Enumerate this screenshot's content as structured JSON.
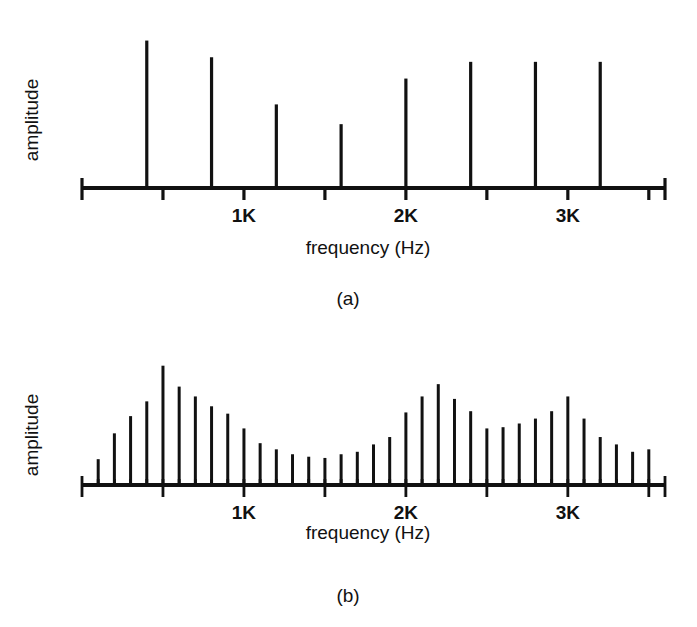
{
  "figure": {
    "background_color": "#ffffff",
    "ink_color": "#111111",
    "panels": [
      {
        "id": "a",
        "caption": "(a)",
        "ylabel": "amplitude",
        "xlabel": "frequency (Hz)",
        "tick_labels": [
          "1K",
          "2K",
          "3K"
        ]
      },
      {
        "id": "b",
        "caption": "(b)",
        "ylabel": "amplitude",
        "xlabel": "frequency (Hz)",
        "tick_labels": [
          "1K",
          "2K",
          "3K"
        ]
      }
    ]
  },
  "chart_data": [
    {
      "type": "bar",
      "id": "panel-a-spectrum",
      "title": "(a)",
      "xlabel": "frequency (Hz)",
      "ylabel": "amplitude",
      "xlim": [
        0,
        3600
      ],
      "ylim": [
        0,
        1.0
      ],
      "grid": false,
      "legend": "none",
      "xticks": [
        0,
        400,
        800,
        1200,
        1600,
        2000,
        2400,
        2800,
        3200,
        3600
      ],
      "xtick_labels": [
        "",
        "",
        "1K",
        "",
        "2K",
        "",
        "3K",
        "",
        "",
        ""
      ],
      "labeled_xticks": [
        {
          "value": 1000,
          "label": "1K"
        },
        {
          "value": 2000,
          "label": "2K"
        },
        {
          "value": 3000,
          "label": "3K"
        }
      ],
      "note": "Harmonic line spectrum: 8 discrete partials at multiples of ~400 Hz",
      "x": [
        400,
        800,
        1200,
        1600,
        2000,
        2400,
        2800,
        3200
      ],
      "values": [
        0.97,
        0.86,
        0.55,
        0.42,
        0.72,
        0.83,
        0.83,
        0.83
      ]
    },
    {
      "type": "bar",
      "id": "panel-b-spectrum",
      "title": "(b)",
      "xlabel": "frequency (Hz)",
      "ylabel": "amplitude",
      "xlim": [
        0,
        3600
      ],
      "ylim": [
        0,
        1.0
      ],
      "grid": false,
      "legend": "none",
      "labeled_xticks": [
        {
          "value": 1000,
          "label": "1K"
        },
        {
          "value": 2000,
          "label": "2K"
        },
        {
          "value": 3000,
          "label": "3K"
        }
      ],
      "note": "Dense harmonic line spectrum with formant envelope peaks near 600 Hz, 2200 Hz and 3000 Hz",
      "x": [
        100,
        200,
        300,
        400,
        500,
        600,
        700,
        800,
        900,
        1000,
        1100,
        1200,
        1300,
        1400,
        1500,
        1600,
        1700,
        1800,
        1900,
        2000,
        2100,
        2200,
        2300,
        2400,
        2500,
        2600,
        2700,
        2800,
        2900,
        3000,
        3100,
        3200,
        3300,
        3400,
        3500
      ],
      "values": [
        0.21,
        0.42,
        0.56,
        0.68,
        0.97,
        0.8,
        0.72,
        0.64,
        0.58,
        0.46,
        0.34,
        0.29,
        0.25,
        0.23,
        0.22,
        0.25,
        0.27,
        0.33,
        0.39,
        0.59,
        0.72,
        0.82,
        0.7,
        0.6,
        0.46,
        0.47,
        0.5,
        0.54,
        0.6,
        0.72,
        0.54,
        0.39,
        0.33,
        0.27,
        0.29
      ]
    }
  ]
}
